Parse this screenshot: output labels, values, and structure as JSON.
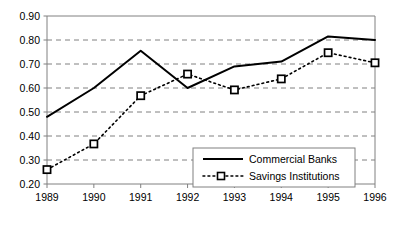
{
  "chart_data": {
    "type": "line",
    "title": "",
    "subtitle": "",
    "xlabel": "",
    "ylabel": "",
    "categories": [
      "1989",
      "1990",
      "1991",
      "1992",
      "1993",
      "1994",
      "1995",
      "1996"
    ],
    "x": [
      1989,
      1990,
      1991,
      1992,
      1993,
      1994,
      1995,
      1996
    ],
    "xlim": [
      1989,
      1996
    ],
    "ylim": [
      0.2,
      0.9
    ],
    "ytick_labels": [
      "0.90",
      "0.80",
      "0.70",
      "0.60",
      "0.50",
      "0.40",
      "0.30",
      "0.20"
    ],
    "ytick_values": [
      0.9,
      0.8,
      0.7,
      0.6,
      0.5,
      0.4,
      0.3,
      0.2
    ],
    "ystep": 0.1,
    "grid": "horizontal-dashed",
    "legend_position": "lower-right",
    "series": [
      {
        "name": "Commercial Banks",
        "style": "solid",
        "marker": "none",
        "color": "#000000",
        "values": [
          0.48,
          0.6,
          0.755,
          0.6,
          0.69,
          0.71,
          0.815,
          0.8
        ]
      },
      {
        "name": "Savings Institutions",
        "style": "dotted",
        "marker": "square",
        "color": "#000000",
        "values": [
          0.26,
          0.367,
          0.568,
          0.658,
          0.592,
          0.638,
          0.747,
          0.705
        ]
      }
    ],
    "colors": {
      "axis": "#808080",
      "grid": "#808080",
      "series_1": "#000000",
      "series_2": "#000000",
      "background": "#ffffff",
      "legend_border": "#808080"
    }
  },
  "legend": {
    "items": [
      {
        "label": "Commercial Banks"
      },
      {
        "label": "Savings Institutions"
      }
    ]
  }
}
